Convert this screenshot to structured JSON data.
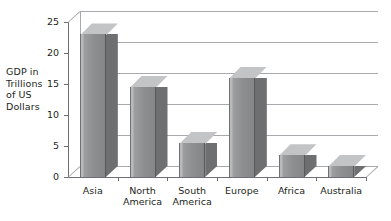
{
  "chart_data": {
    "type": "bar",
    "title": "",
    "xlabel": "",
    "ylabel": "GDP in Trillions of US Dollars",
    "ylabel_lines": [
      "GDP in",
      "Trillions",
      "of US",
      "Dollars"
    ],
    "categories": [
      "Asia",
      "North America",
      "South America",
      "Europe",
      "Africa",
      "Australia"
    ],
    "category_lines": [
      [
        "Asia"
      ],
      [
        "North",
        "America"
      ],
      [
        "South",
        "America"
      ],
      [
        "Europe"
      ],
      [
        "Africa"
      ],
      [
        "Australia"
      ]
    ],
    "values": [
      23,
      14.5,
      5.5,
      16,
      3.5,
      1.8
    ],
    "yticks": [
      0,
      5,
      10,
      15,
      20,
      25
    ],
    "ytick_labels": [
      "0",
      "5",
      "10",
      "15",
      "20",
      "25"
    ],
    "ylim": [
      0,
      25
    ],
    "grid": true,
    "legend": "none",
    "style": "3d-column",
    "colors": {
      "bar_front": "#8d8e8f",
      "bar_top": "#c3c4c5",
      "bar_side": "#6e6f71",
      "gridline": "#a7a9ac",
      "axis": "#6d6e71",
      "text": "#231f20",
      "background": "#ffffff"
    }
  }
}
